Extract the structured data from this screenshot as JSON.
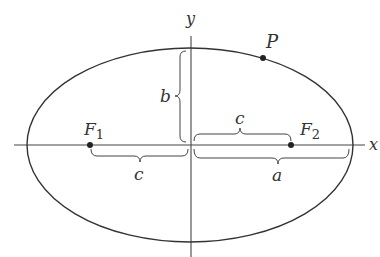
{
  "diagram": {
    "colors": {
      "stroke": "#333333",
      "background": "#ffffff"
    },
    "geometry": {
      "center": [
        190,
        145
      ],
      "semi_major_a": 163,
      "semi_minor_b": 97,
      "focus_offset_c": 101,
      "point_P": [
        262,
        58
      ]
    },
    "labels": {
      "x_axis": "x",
      "y_axis": "y",
      "point": "P",
      "focus1": "F",
      "focus1_sub": "1",
      "focus2": "F",
      "focus2_sub": "2",
      "c_left": "c",
      "c_right": "c",
      "a": "a",
      "b": "b"
    }
  }
}
